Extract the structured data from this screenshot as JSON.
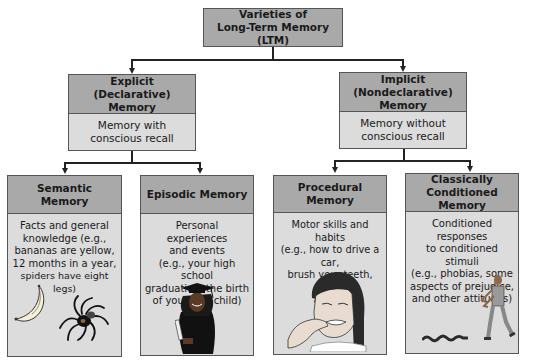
{
  "diagram": {
    "root": {
      "title_line1": "Varieties of",
      "title_line2": "Long-Term Memory (LTM)"
    },
    "explicit": {
      "title_line1": "Explicit (Declarative)",
      "title_line2": "Memory",
      "desc_line1": "Memory with",
      "desc_line2": "conscious recall"
    },
    "implicit": {
      "title_line1": "Implicit (Nondeclarative)",
      "title_line2": "Memory",
      "desc_line1": "Memory without",
      "desc_line2": "conscious recall"
    },
    "semantic": {
      "title": "Semantic Memory",
      "desc": [
        "Facts and general",
        "knowledge (e.g.,",
        "bananas are yellow,",
        "12 months in a year,",
        "spiders have eight legs)"
      ],
      "illustration": [
        "banana-icon",
        "spider-icon"
      ]
    },
    "episodic": {
      "title": "Episodic Memory",
      "desc": [
        "Personal experiences",
        "and events",
        "(e.g., your high school",
        "graduation, the birth",
        "of your first child)"
      ],
      "illustration": [
        "graduate-icon"
      ]
    },
    "procedural": {
      "title": "Procedural Memory",
      "desc": [
        "Motor skills and habits",
        "(e.g., how to drive a car,",
        "brush your teeth, ride",
        "a bike)"
      ],
      "illustration": [
        "girl-brushing-teeth-icon"
      ]
    },
    "classical": {
      "title_line1": "Classically Conditioned",
      "title_line2": "Memory",
      "desc": [
        "Conditioned responses",
        "to conditioned stimuli",
        "(e.g., phobias, some",
        "aspects of prejudice,",
        "and other attitudes)"
      ],
      "illustration": [
        "snake-icon",
        "startled-man-icon"
      ]
    }
  },
  "colors": {
    "header_fill": "#a9a9a9",
    "body_fill": "#dcdcdc",
    "border": "#555555",
    "connector": "#222222"
  }
}
